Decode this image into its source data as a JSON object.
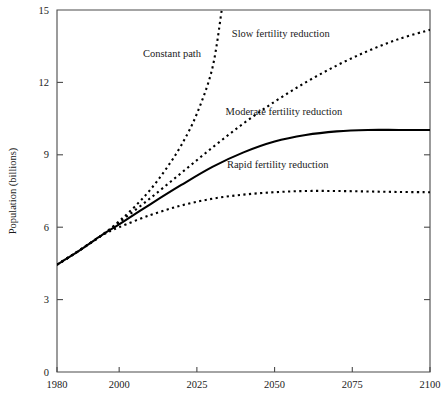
{
  "chart_data": {
    "type": "line",
    "title": "",
    "subtitle": "",
    "xlabel": "",
    "ylabel": "Population (billions)",
    "xlim": [
      1980,
      2100
    ],
    "ylim": [
      0,
      15
    ],
    "grid": false,
    "legend_position": "inline-annotations",
    "x_ticks": [
      {
        "value": 1980,
        "label": "1980"
      },
      {
        "value": 2000,
        "label": "2000"
      },
      {
        "value": 2025,
        "label": "2025"
      },
      {
        "value": 2050,
        "label": "2050"
      },
      {
        "value": 2075,
        "label": "2075"
      },
      {
        "value": 2100,
        "label": "2100"
      }
    ],
    "y_ticks": [
      {
        "value": 0,
        "label": "0"
      },
      {
        "value": 3,
        "label": "3"
      },
      {
        "value": 6,
        "label": "6"
      },
      {
        "value": 9,
        "label": "9"
      },
      {
        "value": 12,
        "label": "12"
      },
      {
        "value": 15,
        "label": "15"
      }
    ],
    "series": [
      {
        "name": "Constant path",
        "style": "dotted",
        "annotation": "Constant path",
        "annotation_x": 2017,
        "annotation_y": 13.05,
        "x": [
          1980,
          1985,
          1990,
          1995,
          2000,
          2005,
          2010,
          2015,
          2020,
          2025,
          2030,
          2033
        ],
        "y": [
          4.45,
          4.85,
          5.28,
          5.72,
          6.25,
          6.85,
          7.55,
          8.4,
          9.4,
          10.7,
          12.6,
          15.0
        ]
      },
      {
        "name": "Slow fertility reduction",
        "style": "dotted",
        "annotation": "Slow fertility reduction",
        "annotation_x": 2052,
        "annotation_y": 13.9,
        "x": [
          1980,
          1985,
          1990,
          1995,
          2000,
          2010,
          2020,
          2030,
          2040,
          2050,
          2060,
          2070,
          2080,
          2090,
          2100
        ],
        "y": [
          4.45,
          4.85,
          5.28,
          5.72,
          6.2,
          7.2,
          8.25,
          9.3,
          10.3,
          11.2,
          12.0,
          12.7,
          13.3,
          13.8,
          14.18
        ]
      },
      {
        "name": "Moderate fertility reduction",
        "style": "solid",
        "annotation": "Moderate fertility reduction",
        "annotation_x": 2053,
        "annotation_y": 10.65,
        "x": [
          1980,
          1985,
          1990,
          1995,
          2000,
          2010,
          2020,
          2030,
          2040,
          2050,
          2060,
          2070,
          2080,
          2090,
          2100
        ],
        "y": [
          4.45,
          4.85,
          5.28,
          5.72,
          6.12,
          6.95,
          7.75,
          8.5,
          9.1,
          9.55,
          9.82,
          9.97,
          10.03,
          10.03,
          10.03
        ]
      },
      {
        "name": "Rapid fertility reduction",
        "style": "dotted",
        "annotation": "Rapid fertility reduction",
        "annotation_x": 2051,
        "annotation_y": 8.45,
        "x": [
          1980,
          1985,
          1990,
          1995,
          2000,
          2010,
          2020,
          2030,
          2040,
          2050,
          2060,
          2070,
          2080,
          2090,
          2100
        ],
        "y": [
          4.45,
          4.85,
          5.28,
          5.7,
          6.0,
          6.5,
          6.9,
          7.18,
          7.35,
          7.45,
          7.5,
          7.5,
          7.48,
          7.46,
          7.45
        ]
      }
    ]
  },
  "plot_geometry": {
    "left": 57,
    "right": 430,
    "top": 10,
    "bottom": 372
  },
  "colors": {
    "line": "#000000",
    "axis": "#4a4a4a",
    "text": "#1a1a1a",
    "background": "#ffffff"
  }
}
